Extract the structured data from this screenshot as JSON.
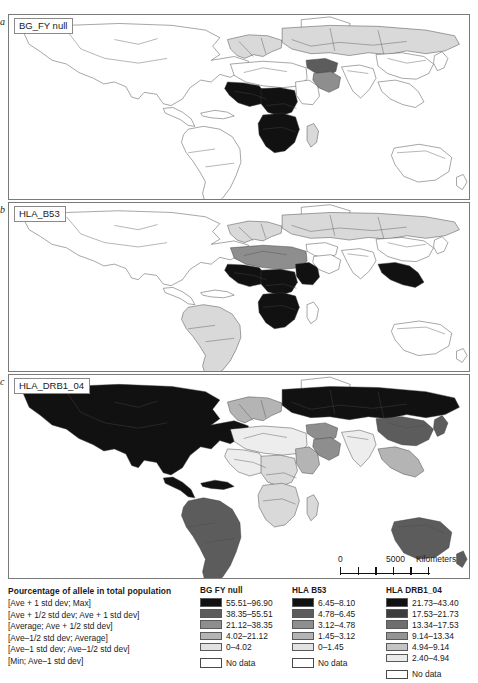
{
  "figure": {
    "panels": [
      {
        "letter": "a",
        "title": "BG_FY null"
      },
      {
        "letter": "b",
        "title": "HLA_B53"
      },
      {
        "letter": "c",
        "title": "HLA_DRB1_04"
      }
    ]
  },
  "scalebar": {
    "zero": "0",
    "max": "5000",
    "units": "Kilometers",
    "tick_count": 6
  },
  "legend": {
    "description": {
      "header": "Pourcentage of allele in total population",
      "rows": [
        "[Ave + 1 std dev; Max]",
        "[Ave + 1/2 std dev; Ave + 1 std dev]",
        "[Average; Ave + 1/2 std dev]",
        "[Ave–1/2 std dev; Average]",
        "[Ave–1 std dev; Ave–1/2 std dev]",
        "[Min; Ave–1 std dev]"
      ]
    },
    "columns": [
      {
        "header": "BG FY null",
        "bins": [
          {
            "range": "55.51–96.90",
            "color": "#111111"
          },
          {
            "range": "38.35–55.51",
            "color": "#5c5c5c"
          },
          {
            "range": "21.12–38.35",
            "color": "#8e8e8e"
          },
          {
            "range": "4.02–21.12",
            "color": "#b4b4b4"
          },
          {
            "range": "0–4.02",
            "color": "#e2e2e2"
          }
        ],
        "no_data": "No data"
      },
      {
        "header": "HLA B53",
        "bins": [
          {
            "range": "6.45–8.10",
            "color": "#111111"
          },
          {
            "range": "4.78–6.45",
            "color": "#5c5c5c"
          },
          {
            "range": "3.12–4.78",
            "color": "#8e8e8e"
          },
          {
            "range": "1.45–3.12",
            "color": "#b4b4b4"
          },
          {
            "range": "0–1.45",
            "color": "#e2e2e2"
          }
        ],
        "no_data": "No data"
      },
      {
        "header": "HLA DRB1_04",
        "bins": [
          {
            "range": "21.73–43.40",
            "color": "#111111"
          },
          {
            "range": "17.53–21.73",
            "color": "#3d3d3d"
          },
          {
            "range": "13.34–17.53",
            "color": "#6e6e6e"
          },
          {
            "range": "9.14–13.34",
            "color": "#949494"
          },
          {
            "range": "4.94–9.14",
            "color": "#c4c4c4"
          },
          {
            "range": "2.40–4.94",
            "color": "#ebebeb"
          }
        ],
        "no_data": "No data"
      }
    ]
  },
  "maps": {
    "panel_a": {
      "name": "BG_FY null world map",
      "regions": [
        {
          "region": "north-america",
          "shade": "g0"
        },
        {
          "region": "greenland",
          "shade": "g0"
        },
        {
          "region": "south-america",
          "shade": "g0"
        },
        {
          "region": "north-africa",
          "shade": "g0"
        },
        {
          "region": "west-africa",
          "shade": "g6"
        },
        {
          "region": "central-africa",
          "shade": "g6"
        },
        {
          "region": "southern-africa",
          "shade": "g6"
        },
        {
          "region": "east-africa",
          "shade": "g0"
        },
        {
          "region": "madagascar",
          "shade": "g2"
        },
        {
          "region": "europe",
          "shade": "g2"
        },
        {
          "region": "russia",
          "shade": "g2"
        },
        {
          "region": "middle-east",
          "shade": "g5"
        },
        {
          "region": "arabia",
          "shade": "g4"
        },
        {
          "region": "south-asia",
          "shade": "g0"
        },
        {
          "region": "east-asia",
          "shade": "g0"
        },
        {
          "region": "southeast-asia",
          "shade": "g0"
        },
        {
          "region": "australia",
          "shade": "g0"
        }
      ]
    },
    "panel_b": {
      "name": "HLA_B53 world map",
      "regions": [
        {
          "region": "north-america",
          "shade": "g0"
        },
        {
          "region": "greenland",
          "shade": "g0"
        },
        {
          "region": "south-america",
          "shade": "g2"
        },
        {
          "region": "north-africa",
          "shade": "g4"
        },
        {
          "region": "west-africa",
          "shade": "g6"
        },
        {
          "region": "central-africa",
          "shade": "g6"
        },
        {
          "region": "southern-africa",
          "shade": "g6"
        },
        {
          "region": "east-africa",
          "shade": "g6"
        },
        {
          "region": "madagascar",
          "shade": "g0"
        },
        {
          "region": "europe",
          "shade": "g2"
        },
        {
          "region": "russia",
          "shade": "g2"
        },
        {
          "region": "middle-east",
          "shade": "g0"
        },
        {
          "region": "arabia",
          "shade": "g0"
        },
        {
          "region": "south-asia",
          "shade": "g0"
        },
        {
          "region": "east-asia",
          "shade": "g0"
        },
        {
          "region": "southeast-asia",
          "shade": "g6"
        },
        {
          "region": "australia",
          "shade": "g0"
        }
      ]
    },
    "panel_c": {
      "name": "HLA_DRB1_04 world map",
      "regions": [
        {
          "region": "north-america",
          "shade": "g6"
        },
        {
          "region": "greenland",
          "shade": "g0"
        },
        {
          "region": "south-america",
          "shade": "g5"
        },
        {
          "region": "north-africa",
          "shade": "g1"
        },
        {
          "region": "west-africa",
          "shade": "g1"
        },
        {
          "region": "central-africa",
          "shade": "g2"
        },
        {
          "region": "southern-africa",
          "shade": "g2"
        },
        {
          "region": "east-africa",
          "shade": "g3"
        },
        {
          "region": "madagascar",
          "shade": "g2"
        },
        {
          "region": "europe",
          "shade": "g3"
        },
        {
          "region": "russia",
          "shade": "g6"
        },
        {
          "region": "middle-east",
          "shade": "g4"
        },
        {
          "region": "arabia",
          "shade": "g4"
        },
        {
          "region": "south-asia",
          "shade": "g1"
        },
        {
          "region": "east-asia",
          "shade": "g5"
        },
        {
          "region": "southeast-asia",
          "shade": "g3"
        },
        {
          "region": "australia",
          "shade": "g5"
        }
      ]
    }
  }
}
